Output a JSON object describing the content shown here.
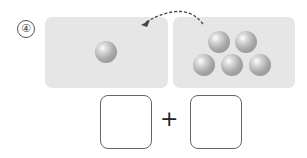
{
  "problem": {
    "number": "④",
    "left_count": 1,
    "right_count": 5,
    "operator": "+",
    "answer_boxes": [
      "",
      ""
    ]
  }
}
